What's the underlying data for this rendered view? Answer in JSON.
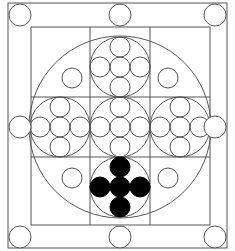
{
  "diagram": {
    "type": "geometric-mandala",
    "canvas": {
      "width": 235,
      "height": 251,
      "background": "#ffffff"
    },
    "colors": {
      "stroke": "#555555",
      "filled": "#000000",
      "background": "#ffffff"
    },
    "outer_frame": {
      "x": 8,
      "y": 3,
      "width": 219,
      "height": 245
    },
    "inner_square": {
      "x": 31,
      "y": 27,
      "width": 179,
      "height": 198
    },
    "grid": {
      "vertical_lines": [
        90,
        150
      ],
      "horizontal_lines": [
        97,
        157
      ],
      "span": {
        "x0": 31,
        "x1": 210,
        "y0": 27,
        "y1": 225
      }
    },
    "large_circle": {
      "cx": 120,
      "cy": 127,
      "r": 91
    },
    "frame_circles": [
      {
        "name": "top-left",
        "cx": 20,
        "cy": 15,
        "r": 11
      },
      {
        "name": "top-middle",
        "cx": 120,
        "cy": 15,
        "r": 11
      },
      {
        "name": "top-right",
        "cx": 215,
        "cy": 15,
        "r": 11
      },
      {
        "name": "middle-left",
        "cx": 20,
        "cy": 127,
        "r": 11
      },
      {
        "name": "middle-right",
        "cx": 215,
        "cy": 127,
        "r": 11
      },
      {
        "name": "bottom-left",
        "cx": 20,
        "cy": 237,
        "r": 11
      },
      {
        "name": "bottom-middle",
        "cx": 120,
        "cy": 237,
        "r": 11
      },
      {
        "name": "bottom-right",
        "cx": 215,
        "cy": 237,
        "r": 11
      }
    ],
    "quadrant_circles": [
      {
        "name": "upper-left",
        "cx": 72,
        "cy": 78,
        "r": 10
      },
      {
        "name": "upper-right",
        "cx": 168,
        "cy": 78,
        "r": 10
      },
      {
        "name": "lower-left",
        "cx": 72,
        "cy": 178,
        "r": 10
      },
      {
        "name": "lower-right",
        "cx": 168,
        "cy": 178,
        "r": 10
      }
    ],
    "cross_cells": [
      {
        "name": "top",
        "cx": 120,
        "cy": 67,
        "r": 30,
        "filled": false
      },
      {
        "name": "left",
        "cx": 60,
        "cy": 127,
        "r": 30,
        "filled": false
      },
      {
        "name": "center",
        "cx": 120,
        "cy": 127,
        "r": 30,
        "filled": false
      },
      {
        "name": "right",
        "cx": 180,
        "cy": 127,
        "r": 30,
        "filled": false
      },
      {
        "name": "bottom",
        "cx": 120,
        "cy": 187,
        "r": 30,
        "filled": true
      }
    ],
    "cell_inner_circle_radius": 10,
    "cell_inner_pattern": "five circles in a plus/cross arrangement (center, up, down, left, right) spaced 20px apart"
  }
}
